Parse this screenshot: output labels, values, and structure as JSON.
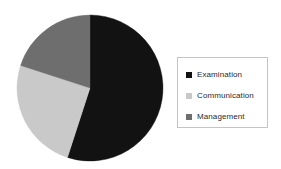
{
  "chart_data": {
    "type": "pie",
    "title": "",
    "categories": [
      "Examination",
      "Communication",
      "Management"
    ],
    "values": [
      55,
      25,
      20
    ],
    "unit": "percent",
    "colors": [
      "#121212",
      "#c9c9c9",
      "#6e6e6e"
    ],
    "legend_position": "right",
    "grid": false,
    "start_angle_deg": 0,
    "direction": "clockwise",
    "slices": [
      {
        "label": "Examination",
        "value": 55,
        "color": "#121212",
        "start_deg": 0,
        "end_deg": 198
      },
      {
        "label": "Communication",
        "value": 25,
        "color": "#c9c9c9",
        "start_deg": 198,
        "end_deg": 288
      },
      {
        "label": "Management",
        "value": 20,
        "color": "#6e6e6e",
        "start_deg": 288,
        "end_deg": 360
      }
    ]
  },
  "legend": {
    "items": [
      {
        "label": "Examination",
        "color": "#121212",
        "swatch_icon": "square-swatch-icon"
      },
      {
        "label": "Communication",
        "color": "#c9c9c9",
        "swatch_icon": "square-swatch-icon"
      },
      {
        "label": "Management",
        "color": "#6e6e6e",
        "swatch_icon": "square-swatch-icon"
      }
    ],
    "border_color": "#c4c4c4"
  },
  "geometry": {
    "center_x": 90,
    "center_y": 88,
    "radius": 73
  }
}
